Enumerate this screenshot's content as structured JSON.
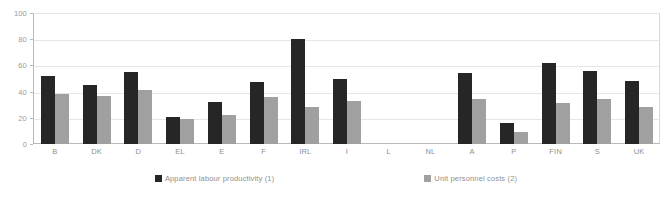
{
  "chart_data": {
    "type": "bar",
    "title": "",
    "subtitle": "",
    "xlabel": "",
    "ylabel": "",
    "ylim": [
      0,
      100
    ],
    "yticks": [
      0,
      20,
      40,
      60,
      80,
      100
    ],
    "grid": true,
    "legend_position": "bottom",
    "categories": [
      "B",
      "DK",
      "D",
      "EL",
      "E",
      "F",
      "IRL",
      "I",
      "L",
      "NL",
      "A",
      "P",
      "FIN",
      "S",
      "UK"
    ],
    "series": [
      {
        "name": "Apparent labour productivity (1)",
        "color": "#262626",
        "values": [
          52,
          45,
          55,
          21,
          32,
          47,
          80,
          50,
          null,
          null,
          54,
          16,
          62,
          56,
          48
        ]
      },
      {
        "name": "Unit personnel costs (2)",
        "color": "#a0a0a0",
        "values": [
          38,
          37,
          41,
          19,
          22,
          36,
          28,
          33,
          null,
          null,
          34,
          9,
          31,
          34,
          28
        ]
      }
    ]
  },
  "colors": {
    "series_dark": "#262626",
    "series_light": "#a0a0a0",
    "gridline": "#e6e6e6",
    "axis": "#b9b9b9",
    "tick_text": "#9a9a9a",
    "label_text": "#8f8f8f",
    "background": "#ffffff"
  }
}
